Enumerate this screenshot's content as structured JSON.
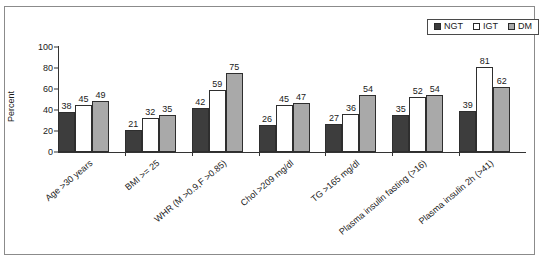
{
  "chart_data": {
    "type": "bar",
    "title": "",
    "xlabel": "",
    "ylabel": "Percent",
    "ylim": [
      0,
      100
    ],
    "yticks": [
      0,
      20,
      40,
      60,
      80,
      100
    ],
    "grid": false,
    "legend_position": "top-right",
    "categories": [
      "Age >30 years",
      "BMI >= 25",
      "WHR (M >0.9,F >0.85)",
      "Chol >209 mg/dl",
      "TG >165 mg/dl",
      "Plasma insulin fasting (>16)",
      "Plasma insulin 2h (>41)"
    ],
    "series": [
      {
        "name": "NGT",
        "color": "#3d3d3d",
        "values": [
          38,
          21,
          42,
          26,
          27,
          35,
          39
        ]
      },
      {
        "name": "IGT",
        "color": "#ffffff",
        "values": [
          45,
          32,
          59,
          45,
          36,
          52,
          81
        ]
      },
      {
        "name": "DM",
        "color": "#a9a9a9",
        "values": [
          49,
          35,
          75,
          47,
          54,
          54,
          62
        ]
      }
    ]
  },
  "legend": {
    "entries": [
      {
        "label": "NGT",
        "swatch": "dark-square-icon"
      },
      {
        "label": "IGT",
        "swatch": "white-square-icon"
      },
      {
        "label": "DM",
        "swatch": "gray-square-icon"
      }
    ]
  }
}
